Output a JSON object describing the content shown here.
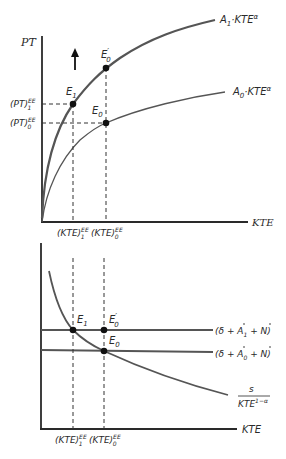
{
  "top_panel": {
    "y_axis_label": "PT",
    "x_axis_label": "KTE",
    "curves": [
      {
        "name": "A1",
        "label_main": "A",
        "label_sub": "1",
        "label_rest": "·KTE",
        "label_sup": "α"
      },
      {
        "name": "A0",
        "label_main": "A",
        "label_sub": "0",
        "label_rest": "·KTE",
        "label_sup": "α"
      }
    ],
    "points": {
      "E1": {
        "main": "E",
        "sub": "1"
      },
      "E0_prime": {
        "main": "E",
        "sup": "′",
        "sub": "0"
      },
      "E0": {
        "main": "E",
        "sub": "0"
      }
    },
    "y_ticks": [
      {
        "main": "(PT)",
        "sup": "EE",
        "sub": "1"
      },
      {
        "main": "(PT)",
        "sup": "EE",
        "sub": "0"
      }
    ],
    "x_ticks": [
      {
        "main": "(KTE)",
        "sup": "EE",
        "sub": "1"
      },
      {
        "main": "(KTE)",
        "sup": "EE",
        "sub": "0"
      }
    ],
    "arrow": "up-shift-arrow"
  },
  "bottom_panel": {
    "x_axis_label": "KTE",
    "lines": [
      {
        "name": "upper",
        "label": "(δ + Ȧ₁ + Ṅ)",
        "parts": [
          "(δ + ",
          "A",
          "1",
          " + ",
          "N",
          ")"
        ]
      },
      {
        "name": "lower",
        "label": "(δ + Ȧ₀ + Ṅ)",
        "parts": [
          "(δ + ",
          "A",
          "0",
          " + ",
          "N",
          ")"
        ]
      }
    ],
    "curve_label": {
      "numerator": "s",
      "denominator_main": "KTE",
      "denominator_sup": "1−α"
    },
    "points": {
      "E1": {
        "main": "E",
        "sub": "1"
      },
      "E0_prime": {
        "main": "E",
        "sup": "′",
        "sub": "0"
      },
      "E0": {
        "main": "E",
        "sub": "0"
      }
    },
    "x_ticks": [
      {
        "main": "(KTE)",
        "sup": "EE",
        "sub": "1"
      },
      {
        "main": "(KTE)",
        "sup": "EE",
        "sub": "0"
      }
    ]
  },
  "colors": {
    "axis": "#2a2a2a",
    "curve": "#555555",
    "dash": "#333333",
    "point": "#111111"
  }
}
